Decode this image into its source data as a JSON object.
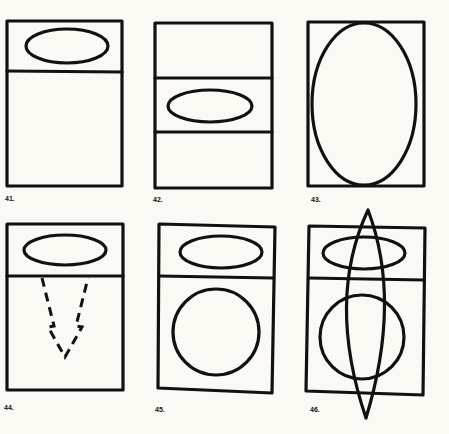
{
  "figures": [
    {
      "id": "fig-41",
      "label": "41.",
      "description": "Rectangle with horizontal band at top containing horizontal ellipse"
    },
    {
      "id": "fig-42",
      "label": "42.",
      "description": "Rectangle divided into three bands with horizontal ellipse in middle band"
    },
    {
      "id": "fig-43",
      "label": "43.",
      "description": "Rectangle containing large vertical ellipse touching top and bottom"
    },
    {
      "id": "fig-44",
      "label": "44.",
      "description": "Rectangle with top band ellipse and dashed downward arrow"
    },
    {
      "id": "fig-45",
      "label": "45.",
      "description": "Rectangle with top band ellipse and circle in lower section"
    },
    {
      "id": "fig-46",
      "label": "46.",
      "description": "Rectangle with top band ellipse, circle, and overlapping pointed vesica shape extending beyond rectangle"
    }
  ],
  "colors": {
    "ink": "#111111",
    "paper": "#faf9f3"
  }
}
